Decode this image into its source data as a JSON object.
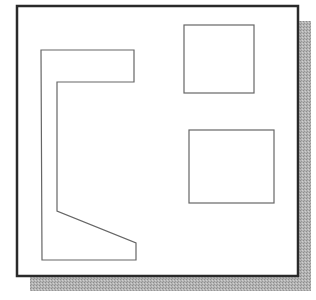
{
  "diagram": {
    "canvas": {
      "width": 316,
      "height": 300,
      "background": "#ffffff"
    },
    "frame": {
      "x": 17,
      "y": 6,
      "width": 281,
      "height": 270,
      "stroke": "#2a2a2a",
      "stroke_width": 2.5,
      "fill": "#ffffff"
    },
    "shadow": {
      "offset_x": 13,
      "offset_y": 15,
      "color": "#a8a8a8"
    },
    "shapes": [
      {
        "id": "bracket-polygon",
        "type": "polygon",
        "points": "41,50 134,50 134,82 57,82 57,211 136,243 136,260 42,260",
        "stroke": "#666666",
        "stroke_width": 1.2
      },
      {
        "id": "top-right-rectangle",
        "type": "rect",
        "x": 184,
        "y": 25,
        "width": 70,
        "height": 68,
        "stroke": "#666666",
        "stroke_width": 1.2
      },
      {
        "id": "bottom-right-rectangle",
        "type": "rect",
        "x": 189,
        "y": 130,
        "width": 85,
        "height": 73,
        "stroke": "#666666",
        "stroke_width": 1.2
      }
    ]
  }
}
